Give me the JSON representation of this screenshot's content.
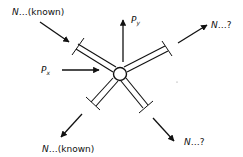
{
  "diagram": {
    "type": "free-body diagram of a truss joint",
    "node": {
      "name": "joint"
    },
    "members": [
      {
        "id": "upper-left",
        "force_label": "N…(known)",
        "arrow_direction": "toward joint"
      },
      {
        "id": "upper-right",
        "force_label": "N…?",
        "arrow_direction": "away from joint"
      },
      {
        "id": "lower-left",
        "force_label": "N…(known)",
        "arrow_direction": "away from joint"
      },
      {
        "id": "lower-right",
        "force_label": "N…?",
        "arrow_direction": "away from joint"
      }
    ],
    "loads": [
      {
        "id": "px",
        "symbol": "P",
        "subscript": "x",
        "direction": "right"
      },
      {
        "id": "py",
        "symbol": "P",
        "subscript": "y",
        "direction": "up"
      }
    ],
    "labels": {
      "ul_n": "N",
      "ul_rest": "…(known)",
      "ur_n": "N",
      "ur_rest": "…?",
      "ll_n": "N",
      "ll_rest": "…(known)",
      "lr_n": "N",
      "lr_rest": "…?",
      "px_sym": "P",
      "px_sub": "x",
      "py_sym": "P",
      "py_sub": "y"
    }
  }
}
